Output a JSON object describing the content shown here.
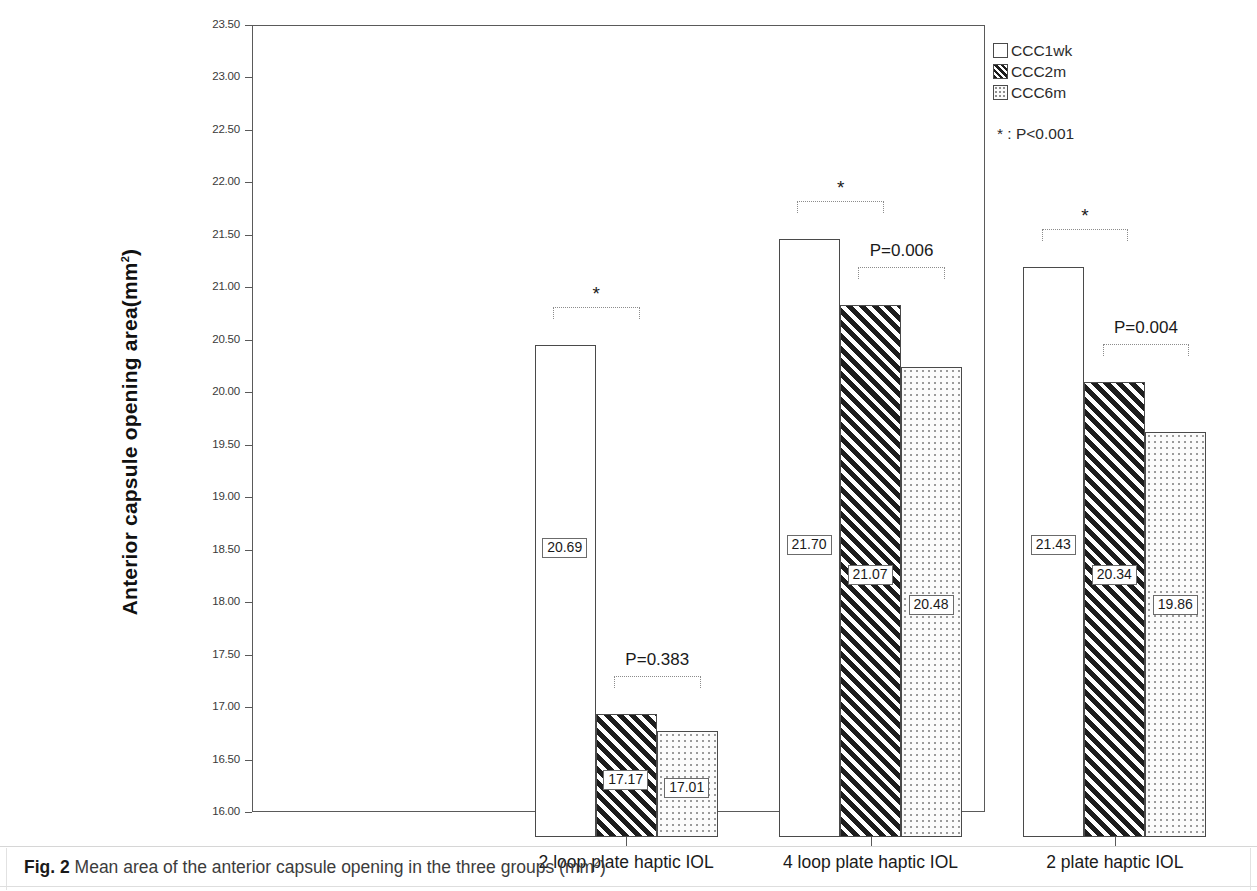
{
  "caption": {
    "tag": "Fig. 2",
    "text": "Mean area of the anterior capsule opening in the three groups (mm",
    "sup": "2",
    "text_end": ")"
  },
  "legend": {
    "items": [
      {
        "label": "CCC1wk",
        "pattern": "plain"
      },
      {
        "label": "CCC2m",
        "pattern": "hatch"
      },
      {
        "label": "CCC6m",
        "pattern": "dots"
      }
    ],
    "note": "* : P<0.001"
  },
  "axis": {
    "y_title_main": "Anterior capsule opening area(mm",
    "y_title_sup": "2",
    "y_title_end": ")",
    "y_ticks": [
      "23.50",
      "23.00",
      "22.50",
      "22.00",
      "21.50",
      "21.00",
      "20.50",
      "20.00",
      "19.50",
      "19.00",
      "18.50",
      "18.00",
      "17.50",
      "17.00",
      "16.50",
      "16.00"
    ]
  },
  "chart_data": {
    "type": "bar",
    "title": "Mean area of the anterior capsule opening in the three groups (mm2)",
    "xlabel": "",
    "ylabel": "Anterior capsule opening area(mm2)",
    "ylim": [
      16.0,
      23.5
    ],
    "ytick_step": 0.5,
    "grid": false,
    "legend_position": "right",
    "categories": [
      "2 loop plate haptic IOL",
      "4 loop plate haptic IOL",
      "2 plate haptic IOL"
    ],
    "series": [
      {
        "name": "CCC1wk",
        "pattern": "plain",
        "values": [
          20.69,
          21.7,
          21.43
        ],
        "labels": [
          "20.69",
          "21.70",
          "21.43"
        ]
      },
      {
        "name": "CCC2m",
        "pattern": "hatch",
        "values": [
          17.17,
          21.07,
          20.34
        ],
        "labels": [
          "17.17",
          "21.07",
          "20.34"
        ]
      },
      {
        "name": "CCC6m",
        "pattern": "dots",
        "values": [
          17.01,
          20.48,
          19.86
        ],
        "labels": [
          "17.01",
          "20.48",
          "19.86"
        ]
      }
    ],
    "annotations": [
      {
        "group": "2 loop plate haptic IOL",
        "between": [
          "CCC1wk",
          "CCC2m"
        ],
        "label": "*"
      },
      {
        "group": "2 loop plate haptic IOL",
        "between": [
          "CCC2m",
          "CCC6m"
        ],
        "label": "P=0.383"
      },
      {
        "group": "4 loop plate haptic IOL",
        "between": [
          "CCC1wk",
          "CCC2m"
        ],
        "label": "*"
      },
      {
        "group": "4 loop plate haptic IOL",
        "between": [
          "CCC2m",
          "CCC6m"
        ],
        "label": "P=0.006"
      },
      {
        "group": "2 plate haptic IOL",
        "between": [
          "CCC1wk",
          "CCC2m"
        ],
        "label": "*"
      },
      {
        "group": "2 plate haptic IOL",
        "between": [
          "CCC2m",
          "CCC6m"
        ],
        "label": "P=0.004"
      }
    ],
    "significance_note": "* : P<0.001"
  }
}
